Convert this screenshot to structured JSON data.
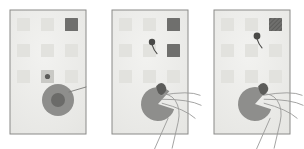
{
  "figure": {
    "title": "Three-panel sequence: robotic gripper approaching and grasping a tile on a gridded board",
    "background_color": "#ffffff",
    "panel_count": 3
  },
  "palette": {
    "panel_fill": "#eeeeec",
    "panel_border": "#8a8a88",
    "tile_light": "#e2e2de",
    "tile_medium": "#c9c9c5",
    "tile_dark": "#6f6f6d",
    "tile_darker": "#5c5c5a",
    "disc_body": "#8e8e8c",
    "disc_inner": "#6b6b69",
    "line_stroke": "#7a7a78",
    "hand_stroke": "#9a9a98",
    "marker_dot": "#4a4a48"
  },
  "panels": [
    {
      "index": 1,
      "name": "panel-approach",
      "label": "Panel 1 — target tile highlighted, gripper disc at rest",
      "x": 10,
      "y": 10,
      "width": 76,
      "height": 124,
      "grid": {
        "rows": 3,
        "cols": 3,
        "cells": [
          {
            "row": 1,
            "col": 1,
            "state": "empty"
          },
          {
            "row": 1,
            "col": 2,
            "state": "empty"
          },
          {
            "row": 1,
            "col": 3,
            "state": "filled-dark"
          },
          {
            "row": 2,
            "col": 1,
            "state": "empty"
          },
          {
            "row": 2,
            "col": 2,
            "state": "empty"
          },
          {
            "row": 2,
            "col": 3,
            "state": "empty"
          },
          {
            "row": 3,
            "col": 1,
            "state": "empty"
          },
          {
            "row": 3,
            "col": 2,
            "state": "filled-medium-dot"
          },
          {
            "row": 3,
            "col": 3,
            "state": "empty"
          }
        ]
      },
      "disc": {
        "cx": 58,
        "cy": 100,
        "r_outer": 16,
        "r_inner": 7,
        "state": "closed"
      },
      "pointer_line": {
        "from_x": 69,
        "from_y": 92,
        "to_x": 86,
        "to_y": 87
      },
      "hand_visible": false,
      "marker_dot": null
    },
    {
      "index": 2,
      "name": "panel-contact",
      "label": "Panel 2 — gripper open, hand fingers entering, marker dot released",
      "x": 112,
      "y": 10,
      "width": 76,
      "height": 124,
      "grid": {
        "rows": 3,
        "cols": 3,
        "cells": [
          {
            "row": 1,
            "col": 1,
            "state": "empty"
          },
          {
            "row": 1,
            "col": 2,
            "state": "empty"
          },
          {
            "row": 1,
            "col": 3,
            "state": "filled-dark"
          },
          {
            "row": 2,
            "col": 1,
            "state": "empty"
          },
          {
            "row": 2,
            "col": 2,
            "state": "empty"
          },
          {
            "row": 2,
            "col": 3,
            "state": "filled-dark"
          },
          {
            "row": 3,
            "col": 1,
            "state": "empty"
          },
          {
            "row": 3,
            "col": 2,
            "state": "empty"
          },
          {
            "row": 3,
            "col": 3,
            "state": "empty"
          }
        ]
      },
      "disc": {
        "cx": 158,
        "cy": 104,
        "r_outer": 17,
        "r_inner": 0,
        "state": "open"
      },
      "pointer_line": null,
      "hand_visible": true,
      "marker_dot": {
        "cx": 152,
        "cy": 42,
        "r": 3.2
      }
    },
    {
      "index": 3,
      "name": "panel-grasp",
      "label": "Panel 3 — tile textured, gripper closing on object, hand withdrawing",
      "x": 214,
      "y": 10,
      "width": 76,
      "height": 124,
      "grid": {
        "rows": 3,
        "cols": 3,
        "cells": [
          {
            "row": 1,
            "col": 1,
            "state": "empty"
          },
          {
            "row": 1,
            "col": 2,
            "state": "empty"
          },
          {
            "row": 1,
            "col": 3,
            "state": "filled-hatched"
          },
          {
            "row": 2,
            "col": 1,
            "state": "empty"
          },
          {
            "row": 2,
            "col": 2,
            "state": "empty"
          },
          {
            "row": 2,
            "col": 3,
            "state": "empty"
          },
          {
            "row": 3,
            "col": 1,
            "state": "empty"
          },
          {
            "row": 3,
            "col": 2,
            "state": "empty"
          },
          {
            "row": 3,
            "col": 3,
            "state": "empty"
          }
        ]
      },
      "disc": {
        "cx": 255,
        "cy": 104,
        "r_outer": 17,
        "r_inner": 0,
        "state": "open"
      },
      "pointer_line": null,
      "hand_visible": true,
      "marker_dot": {
        "cx": 257,
        "cy": 36,
        "r": 3.4
      }
    }
  ],
  "geometry": {
    "tile_size": 13,
    "grid_origin_dx": 7,
    "grid_origin_dy": 8,
    "grid_step_x": 24,
    "grid_step_y": 26
  }
}
